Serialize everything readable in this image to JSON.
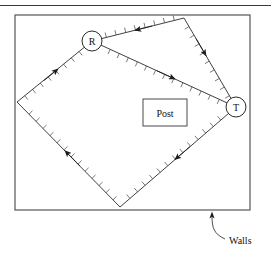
{
  "figure": {
    "title_rule": "top-horizontal-rule",
    "background_color": "#ffffff",
    "stroke_color": "#3a3a3a",
    "path_color": "#2b2b2b",
    "width": 271,
    "height": 255
  },
  "walls": {
    "label": "Walls",
    "rect": {
      "x": 15,
      "y": 15,
      "width": 235,
      "height": 195
    },
    "callout_arrow_tip": {
      "x": 212,
      "y": 213
    },
    "callout_text_anchor": {
      "x": 228,
      "y": 241
    }
  },
  "post": {
    "label": "Post",
    "rect": {
      "x": 143,
      "y": 99,
      "width": 44,
      "height": 27
    }
  },
  "nodes": [
    {
      "id": "R",
      "label": "R",
      "cx": 92,
      "cy": 41,
      "r": 10
    },
    {
      "id": "T",
      "label": "T",
      "cx": 236,
      "cy": 107,
      "r": 10
    }
  ],
  "ray_path": {
    "description": "closed reflected ray polygon with hatch ticks and direction arrowheads",
    "vertices": [
      {
        "name": "node-R",
        "x": 92,
        "y": 41
      },
      {
        "name": "top-right-bounce",
        "x": 184,
        "y": 18
      },
      {
        "name": "node-T",
        "x": 236,
        "y": 107
      },
      {
        "name": "bottom-bounce",
        "x": 120,
        "y": 207
      },
      {
        "name": "left-bounce",
        "x": 17,
        "y": 102
      }
    ],
    "segments": [
      {
        "from": "top-right-bounce",
        "to": "node-R",
        "arrow_direction": "toward-R"
      },
      {
        "from": "node-R",
        "to": "node-T",
        "arrow_direction": "toward-T"
      },
      {
        "from": "top-right-bounce",
        "to": "node-T",
        "arrow_direction": "toward-T"
      },
      {
        "from": "node-T",
        "to": "bottom-bounce",
        "arrow_direction": "toward-bottom"
      },
      {
        "from": "bottom-bounce",
        "to": "left-bounce",
        "arrow_direction": "toward-left"
      },
      {
        "from": "left-bounce",
        "to": "node-R",
        "arrow_direction": "toward-R"
      }
    ],
    "tick_spacing_px": 10,
    "tick_length_px": 5
  }
}
